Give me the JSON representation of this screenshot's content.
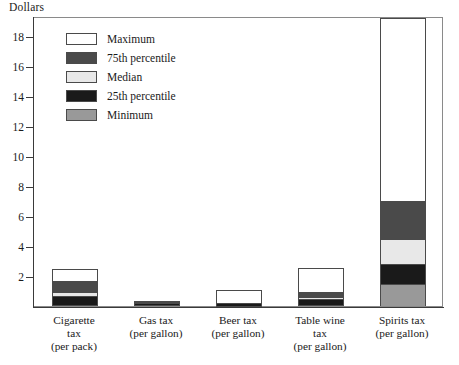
{
  "chart_data": {
    "type": "bar",
    "title": "",
    "ylabel": "Dollars",
    "xlabel": "",
    "stacked": true,
    "grid": false,
    "ylim": [
      0,
      19.33
    ],
    "yticks": [
      2,
      4,
      6,
      8,
      10,
      12,
      14,
      16,
      18
    ],
    "ytick_labels": [
      "2",
      "4",
      "6",
      "8",
      "10",
      "12",
      "14",
      "16",
      "18"
    ],
    "categories": [
      "Cigarette\ntax\n(per pack)",
      "Gas tax\n(per gallon)",
      "Beer tax\n(per gallon)",
      "Table wine\ntax\n(per gallon)",
      "Spirits tax\n(per gallon)"
    ],
    "legend_position": "upper-left",
    "series": [
      {
        "name": "Minimum",
        "color": "#999999",
        "values": [
          0.05,
          0.08,
          0.02,
          0.05,
          1.5
        ]
      },
      {
        "name": "25th percentile",
        "color": "#1a1a1a",
        "values": [
          0.7,
          0.2,
          0.18,
          0.45,
          2.8
        ]
      },
      {
        "name": "Median",
        "color": "#e8e8e8",
        "values": [
          0.95,
          0.25,
          0.2,
          0.62,
          4.5
        ]
      },
      {
        "name": "75th percentile",
        "color": "#4a4a4a",
        "values": [
          1.65,
          0.28,
          0.22,
          0.92,
          7.0
        ]
      },
      {
        "name": "Maximum",
        "color": "#ffffff",
        "values": [
          2.5,
          0.32,
          1.05,
          2.55,
          19.2
        ]
      }
    ],
    "legend_order": [
      "Maximum",
      "75th percentile",
      "Median",
      "25th percentile",
      "Minimum"
    ]
  },
  "legend": {
    "items": [
      {
        "label": "Maximum",
        "color": "#ffffff"
      },
      {
        "label": "75th percentile",
        "color": "#4a4a4a"
      },
      {
        "label": "Median",
        "color": "#e8e8e8"
      },
      {
        "label": "25th percentile",
        "color": "#1a1a1a"
      },
      {
        "label": "Minimum",
        "color": "#999999"
      }
    ]
  }
}
